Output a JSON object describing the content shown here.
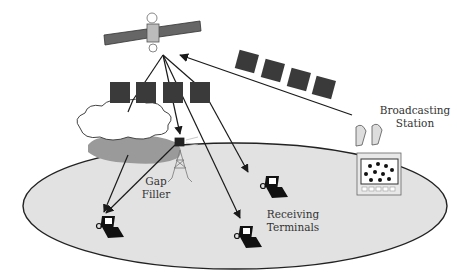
{
  "diagram": {
    "type": "satellite-broadcasting-system",
    "labels": {
      "broadcasting_station_line1": "Broadcasting",
      "broadcasting_station_line2": "Station",
      "gap_filler_line1": "Gap",
      "gap_filler_line2": "Filler",
      "receiving_terminals_line1": "Receiving",
      "receiving_terminals_line2": "Terminals"
    },
    "nodes": [
      {
        "id": "satellite",
        "icon": "satellite-icon"
      },
      {
        "id": "broadcasting-station",
        "icon": "broadcast-station-icon"
      },
      {
        "id": "gap-filler",
        "icon": "gap-filler-tower-icon"
      },
      {
        "id": "cloud",
        "icon": "cloud-icon"
      },
      {
        "id": "terminal-1",
        "icon": "laptop-terminal-icon"
      },
      {
        "id": "terminal-2",
        "icon": "laptop-terminal-icon"
      },
      {
        "id": "terminal-3",
        "icon": "laptop-terminal-icon"
      }
    ],
    "colors": {
      "coverage_fill": "#e2e2e2",
      "packet_fill": "#3a3a3a",
      "line": "#1a1a1a",
      "cloud_shadow": "#9a9a9a"
    }
  }
}
